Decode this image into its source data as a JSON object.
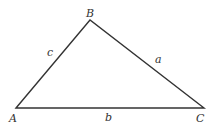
{
  "diagram": {
    "type": "triangle",
    "vertices": [
      {
        "id": "A",
        "label": "A",
        "x": 16,
        "y": 108,
        "lx": 9,
        "ly": 122
      },
      {
        "id": "B",
        "label": "B",
        "x": 90,
        "y": 20,
        "lx": 86,
        "ly": 17
      },
      {
        "id": "C",
        "label": "C",
        "x": 204,
        "y": 108,
        "lx": 196,
        "ly": 122
      }
    ],
    "sides": [
      {
        "id": "a",
        "label": "a",
        "from": "B",
        "to": "C",
        "lx": 155,
        "ly": 63
      },
      {
        "id": "b",
        "label": "b",
        "from": "A",
        "to": "C",
        "lx": 105,
        "ly": 121
      },
      {
        "id": "c",
        "label": "c",
        "from": "A",
        "to": "B",
        "lx": 47,
        "ly": 56
      }
    ],
    "stroke_color": "#333333"
  }
}
